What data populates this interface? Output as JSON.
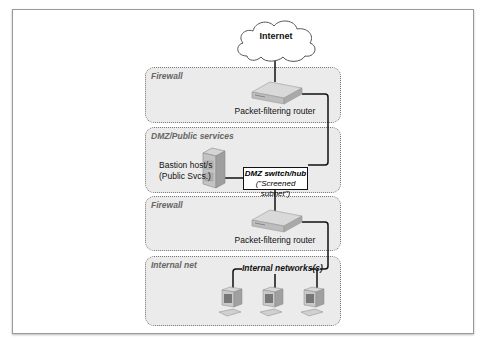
{
  "diagram": {
    "cloud": {
      "label": "Internet"
    },
    "zones": [
      {
        "label": "Firewall",
        "device": "Packet-filtering router"
      },
      {
        "label": "DMZ/Public services",
        "server_label_1": "Bastion host/s",
        "server_label_2": "(Public Svcs.)",
        "hub_label_1": "DMZ switch/hub",
        "hub_label_2": "(\"Screened subnet\")"
      },
      {
        "label": "Firewall",
        "device": "Packet-filtering router"
      },
      {
        "label": "Internal net",
        "network_label": "Internal networks(s)"
      }
    ],
    "colors": {
      "zone_fill": "#ebebeb",
      "zone_border": "#777777",
      "line": "#111111"
    }
  }
}
